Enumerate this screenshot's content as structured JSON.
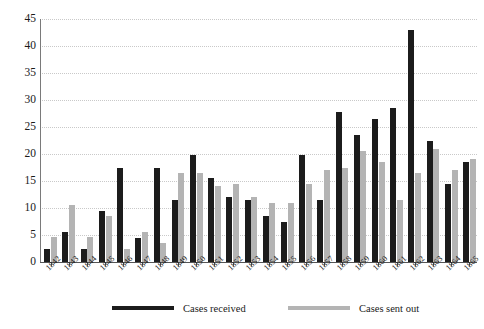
{
  "chart_data": {
    "type": "bar",
    "title": "",
    "xlabel": "",
    "ylabel": "",
    "ylim": [
      0,
      45
    ],
    "ytick_step": 5,
    "grid": true,
    "grid_style": "dotted-horizontal",
    "legend_position": "bottom",
    "categories": [
      "1842",
      "1843",
      "1844",
      "1845",
      "1846",
      "1847",
      "1848",
      "1849",
      "1850",
      "1851",
      "1852",
      "1853",
      "1854",
      "1855",
      "1856",
      "1857",
      "1858",
      "1859",
      "1860",
      "1861",
      "1862",
      "1863",
      "1864",
      "1865"
    ],
    "yticks": [
      "0",
      "5",
      "10",
      "15",
      "20",
      "25",
      "30",
      "35",
      "40",
      "45"
    ],
    "series": [
      {
        "name": "Cases received",
        "color": "#1c1c1c",
        "values": [
          2.5,
          5.5,
          2.5,
          9.5,
          17.5,
          4.5,
          17.5,
          11.5,
          19.8,
          15.5,
          12,
          11.5,
          8.5,
          7.5,
          19.8,
          11.5,
          27.8,
          23.5,
          26.5,
          28.5,
          43,
          22.5,
          14.5,
          18.5
        ]
      },
      {
        "name": "Cases sent out",
        "color": "#b4b4b4",
        "values": [
          4.7,
          10.5,
          4.7,
          8.5,
          2.5,
          5.5,
          3.5,
          16.5,
          16.5,
          14,
          14.5,
          12,
          11,
          11,
          14.5,
          17,
          17.5,
          20.5,
          18.5,
          11.5,
          16.5,
          21,
          17,
          19
        ]
      }
    ]
  },
  "legend": {
    "received_label": "Cases received",
    "sent_label": "Cases sent out"
  },
  "caption": {
    "text": ""
  }
}
